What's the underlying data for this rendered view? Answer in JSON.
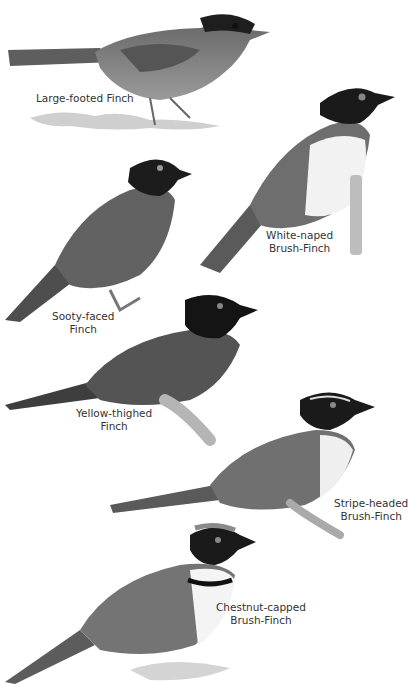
{
  "plate": {
    "background": "#ffffff",
    "style": "grayscale field-guide illustration",
    "birds": [
      {
        "name": "Large-footed Finch",
        "label_lines": [
          "Large-footed Finch"
        ]
      },
      {
        "name": "White-naped Brush-Finch",
        "label_lines": [
          "White-naped",
          "Brush-Finch"
        ]
      },
      {
        "name": "Sooty-faced Finch",
        "label_lines": [
          "Sooty-faced",
          "Finch"
        ]
      },
      {
        "name": "Yellow-thighed Finch",
        "label_lines": [
          "Yellow-thighed",
          "Finch"
        ]
      },
      {
        "name": "Stripe-headed Brush-Finch",
        "label_lines": [
          "Stripe-headed",
          "Brush-Finch"
        ]
      },
      {
        "name": "Chestnut-capped Brush-Finch",
        "label_lines": [
          "Chestnut-capped",
          "Brush-Finch"
        ]
      }
    ]
  }
}
